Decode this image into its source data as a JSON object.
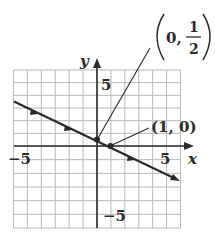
{
  "chart_data": {
    "type": "line",
    "title": "",
    "xlabel": "x",
    "ylabel": "y",
    "xlim": [
      -6,
      6
    ],
    "ylim": [
      -6,
      6
    ],
    "grid": true,
    "x_ticks_labeled": [
      -5,
      5
    ],
    "y_ticks_labeled": [
      5,
      -5
    ],
    "tick_labels": {
      "x_neg": "−5",
      "x_pos": "5",
      "y_pos": "5",
      "y_neg": "−5"
    },
    "series": [
      {
        "name": "line",
        "equation": "y = -x/2 + 1/2",
        "slope": -0.5,
        "intercept": 0.5,
        "x": [
          -6,
          6
        ],
        "y": [
          3.5,
          -2.5
        ],
        "arrows": "both-directions-on-line",
        "color": "#2a2a2a"
      }
    ],
    "points": [
      {
        "x": 0,
        "y": 0.5,
        "label": "(0, 1/2)"
      },
      {
        "x": 1,
        "y": 0,
        "label": "(1, 0)"
      }
    ],
    "annotations": [
      {
        "text": "(0, 1/2)",
        "numerator": "1",
        "denominator": "2",
        "prefix": "0,",
        "target": [
          0,
          0.5
        ]
      },
      {
        "text": "(1, 0)",
        "target": [
          1,
          0
        ]
      }
    ]
  },
  "labels": {
    "x_axis": "x",
    "y_axis": "y",
    "x_neg": "−5",
    "x_pos": "5",
    "y_pos": "5",
    "y_neg": "−5",
    "point_b": "(1, 0)",
    "point_a_prefix": "0,",
    "point_a_num": "1",
    "point_a_den": "2"
  },
  "colors": {
    "grid": "#b8b8b8",
    "ink": "#2a2a2a"
  }
}
